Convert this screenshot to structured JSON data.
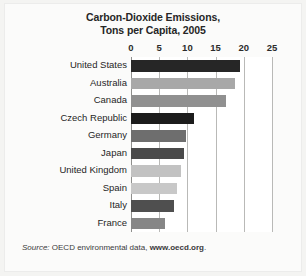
{
  "chart_data": {
    "type": "bar",
    "orientation": "horizontal",
    "title": "Carbon-Dioxide Emissions, Tons per Capita, 2005",
    "title_line1": "Carbon-Dioxide Emissions,",
    "title_line2": "Tons per Capita, 2005",
    "xlabel": "",
    "ylabel": "",
    "xlim": [
      0,
      25
    ],
    "xticks": [
      0,
      5,
      10,
      15,
      20,
      25
    ],
    "xtick_labels": [
      "0",
      "5",
      "10",
      "15",
      "20",
      "25"
    ],
    "grid": true,
    "grid_axis": "x",
    "legend": false,
    "categories": [
      "United States",
      "Australia",
      "Canada",
      "Czech Republic",
      "Germany",
      "Japan",
      "United Kingdom",
      "Spain",
      "Italy",
      "France"
    ],
    "values": [
      19.3,
      18.4,
      16.8,
      11.2,
      9.8,
      9.4,
      8.8,
      8.2,
      7.7,
      6.0
    ],
    "bar_colors": [
      "#262626",
      "#a8a8a8",
      "#909090",
      "#1c1c1c",
      "#6e6e6e",
      "#4a4a4a",
      "#c2c2c2",
      "#c8c8c8",
      "#4f4f4f",
      "#868686"
    ],
    "bars": [
      {
        "label": "United States",
        "value": 19.3,
        "color": "#262626"
      },
      {
        "label": "Australia",
        "value": 18.4,
        "color": "#a8a8a8"
      },
      {
        "label": "Canada",
        "value": 16.8,
        "color": "#909090"
      },
      {
        "label": "Czech Republic",
        "value": 11.2,
        "color": "#1c1c1c"
      },
      {
        "label": "Germany",
        "value": 9.8,
        "color": "#6e6e6e"
      },
      {
        "label": "Japan",
        "value": 9.4,
        "color": "#4a4a4a"
      },
      {
        "label": "United Kingdom",
        "value": 8.8,
        "color": "#c2c2c2"
      },
      {
        "label": "Spain",
        "value": 8.2,
        "color": "#c8c8c8"
      },
      {
        "label": "Italy",
        "value": 7.7,
        "color": "#4f4f4f"
      },
      {
        "label": "France",
        "value": 6.0,
        "color": "#868686"
      }
    ]
  },
  "source": {
    "prefix": "Source:",
    "text": " OECD environmental data, ",
    "url": "www.oecd.org",
    "suffix": "."
  },
  "colors": {
    "page_background": "#fbfbfa",
    "plot_background": "#ffffff",
    "gridline": "#b9b9b7",
    "text": "#1f1f1f"
  }
}
